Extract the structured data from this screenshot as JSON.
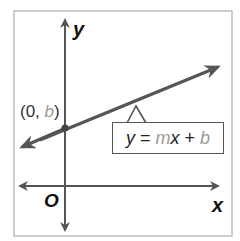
{
  "diagram": {
    "type": "coordinate-plane-line",
    "axes": {
      "x_label": "x",
      "y_label": "y",
      "origin_label": "O"
    },
    "point": {
      "open": "(0, ",
      "var": "b",
      "close": ")"
    },
    "equation": {
      "y": "y",
      "eq": "=",
      "m": "m",
      "x": "x",
      "plus": "+",
      "b": "b"
    },
    "colors": {
      "axis": "#555555",
      "line": "#555555",
      "frame": "#b8b8b8",
      "highlight_var": "#9a9a9a"
    }
  }
}
